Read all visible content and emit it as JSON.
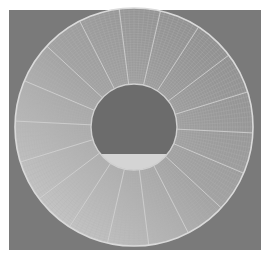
{
  "image": {
    "subject": "annular mesh disk with radial spokes",
    "width": 270,
    "height": 260
  },
  "colors": {
    "border": "#ffffff",
    "background": "#7a7a7a",
    "ring_face": "#9c9c9c",
    "ring_face_light": "#c4c4c4",
    "rim": "#d8d8d8",
    "spoke": "#cfcfcf",
    "mesh": "#b0b0b0",
    "hole": "#6e6e6e",
    "hole_segment": "#d6d6d6"
  },
  "geometry": {
    "center": [
      134,
      127
    ],
    "outer_radius": 119,
    "inner_radius": 43,
    "spoke_count": 18,
    "mesh_ring_count": 30,
    "hole_segment_top_y": 154
  }
}
